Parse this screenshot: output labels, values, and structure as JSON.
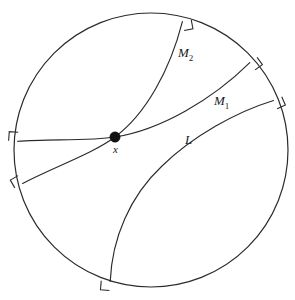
{
  "figure": {
    "name": "poincare-disk-geodesics",
    "background_color": "#ffffff",
    "ink_color": "#2b2b2b"
  },
  "boundary": {
    "name": "boundary-circle",
    "cx": 151,
    "cy": 150,
    "r": 137,
    "stroke": "#2b2b2b",
    "fill": "#ffffff"
  },
  "point": {
    "label": "x",
    "cx": 115,
    "cy": 137,
    "r": 5.2,
    "label_x": 113,
    "label_y": 153,
    "color": "#111111"
  },
  "geodesics": [
    {
      "id": "M2",
      "label_base": "M",
      "label_sub": "2",
      "label_x": 178,
      "label_y": 57,
      "path": "M 22.6 183.4 C 56 166 92 154 115 137 C 146 114 170 70 182.4 21.6",
      "endpoints": [
        {
          "x": 22.6,
          "y": 183.4
        },
        {
          "x": 182.4,
          "y": 21.6
        }
      ]
    },
    {
      "id": "M1",
      "label_base": "M",
      "label_sub": "1",
      "label_x": 214,
      "label_y": 105,
      "path": "M 17.6 141.3 C 50 139 90 141 115 137 C 160 130 212 100 249.8 62.6",
      "endpoints": [
        {
          "x": 17.6,
          "y": 141.3
        },
        {
          "x": 249.8,
          "y": 62.6
        }
      ]
    },
    {
      "id": "L",
      "label_base": "L",
      "label_sub": "",
      "label_x": 185,
      "label_y": 144,
      "path": "M 110.2 281.5 C 112 238 130 196 162 166 C 193 136 236 112 273.5 100.5",
      "endpoints": [
        {
          "x": 110.2,
          "y": 281.5
        },
        {
          "x": 273.5,
          "y": 100.5
        }
      ]
    }
  ],
  "right_angle_marks": [
    {
      "name": "right-angle-M1-left",
      "x": 17.6,
      "y": 141.3,
      "a1": 184,
      "a2": 274
    },
    {
      "name": "right-angle-M2-left",
      "x": 22.6,
      "y": 183.4,
      "a1": 150,
      "a2": 240
    },
    {
      "name": "right-angle-M2-top",
      "x": 182.4,
      "y": 21.6,
      "a1": 349,
      "a2": 79
    },
    {
      "name": "right-angle-M1-right",
      "x": 249.8,
      "y": 62.6,
      "a1": 324,
      "a2": 54
    },
    {
      "name": "right-angle-L-right",
      "x": 273.5,
      "y": 100.5,
      "a1": 336,
      "a2": 66
    },
    {
      "name": "right-angle-L-bottom",
      "x": 110.2,
      "y": 281.5,
      "a1": 95,
      "a2": 185
    }
  ],
  "mark_size": 9
}
